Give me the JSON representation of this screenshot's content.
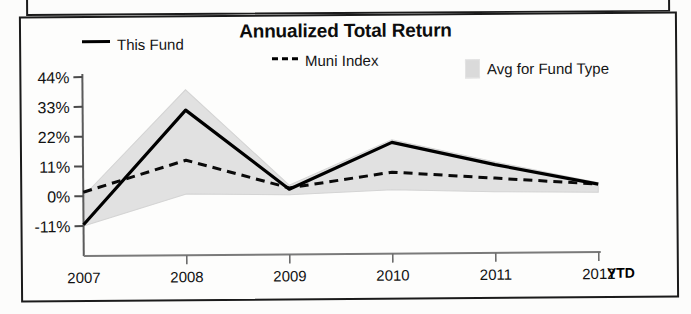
{
  "chart_data": {
    "type": "line",
    "title": "Annualized Total Return",
    "xlabel": "",
    "ylabel": "",
    "categories": [
      "2007",
      "2008",
      "2009",
      "2010",
      "2011",
      "2012"
    ],
    "x_axis_suffix": "YTD",
    "ytick_labels": [
      "44%",
      "33%",
      "22%",
      "11%",
      "0%",
      "-11%"
    ],
    "ytick_values": [
      44,
      33,
      22,
      11,
      0,
      -11
    ],
    "ylim": [
      -11,
      44
    ],
    "grid": false,
    "legend_position": "top",
    "series": [
      {
        "name": "This Fund",
        "style": "solid",
        "color": "#000000",
        "values": [
          -10.5,
          31.5,
          2.0,
          19.0,
          10.5,
          3.0
        ]
      },
      {
        "name": "Muni Index",
        "style": "dashed",
        "color": "#000000",
        "values": [
          1.5,
          13.0,
          2.5,
          8.0,
          5.5,
          3.0
        ]
      },
      {
        "name": "Avg for Fund Type",
        "style": "band",
        "color": "#dcdcdc",
        "band_upper": [
          0.0,
          39.0,
          3.5,
          20.0,
          11.5,
          3.5
        ],
        "band_lower": [
          -11.0,
          0.5,
          0.0,
          1.5,
          0.5,
          0.0
        ]
      }
    ]
  },
  "chart": {
    "title": "Annualized Total Return",
    "legend": [
      {
        "label": "This Fund",
        "swatch": "solid-line-swatch"
      },
      {
        "label": "Muni Index",
        "swatch": "dashed-line-swatch"
      },
      {
        "label": "Avg for Fund Type",
        "swatch": "shaded-band-swatch"
      }
    ],
    "y_axis": {
      "ticks": [
        "44%",
        "33%",
        "22%",
        "11%",
        "0%",
        "-11%"
      ]
    },
    "x_axis": {
      "ticks": [
        "2007",
        "2008",
        "2009",
        "2010",
        "2011",
        "2012"
      ],
      "suffix": "YTD"
    }
  }
}
